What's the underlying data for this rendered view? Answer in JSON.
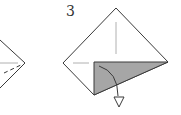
{
  "diagram": {
    "type": "origami-instruction",
    "steps": [
      {
        "id": "step-2-partial",
        "label": "",
        "description": "Partially visible previous step: right corner of square with crease and dashed fold line"
      },
      {
        "id": "step-3",
        "label": "3",
        "description": "Square paper diamond with bottom-right flap shaded grey, curved arrow indicating fold down (valley fold arrow)"
      }
    ],
    "colors": {
      "line": "#3a3a3a",
      "crease": "#b0b0b0",
      "shade": "#a6a6a6",
      "background": "#ffffff"
    },
    "icons": {
      "fold_arrow": "hollow-triangle-arrowhead"
    }
  }
}
